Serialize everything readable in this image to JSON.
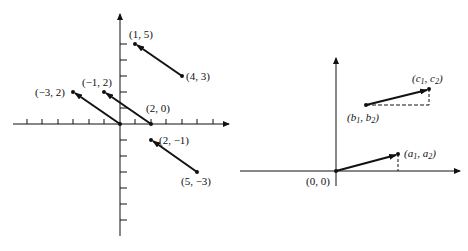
{
  "left_diagram": {
    "title": "",
    "origin_px": [
      120,
      124
    ],
    "unit_px": [
      15.5,
      16
    ],
    "x_ticks": [
      -6,
      -5,
      -4,
      -3,
      -2,
      -1,
      1,
      2,
      3,
      4,
      5,
      6
    ],
    "y_ticks": [
      -7,
      -6,
      -5,
      -4,
      -3,
      -2,
      -1,
      1,
      2,
      3,
      4,
      5
    ],
    "vectors": [
      {
        "from": [
          4,
          3
        ],
        "to": [
          1,
          5
        ],
        "from_label": "(4, 3)",
        "to_label": "(1, 5)"
      },
      {
        "from": [
          2,
          0
        ],
        "to": [
          -1,
          2
        ],
        "from_label": "(2, 0)",
        "to_label": "(−1, 2)"
      },
      {
        "from": [
          0,
          0
        ],
        "to": [
          -3,
          2
        ],
        "from_label": "",
        "to_label": "(−3, 2)"
      },
      {
        "from": [
          5,
          -3
        ],
        "to": [
          2,
          -1
        ],
        "from_label": "(5, −3)",
        "to_label": "(2, −1)"
      }
    ],
    "labels": {
      "p15": "(1, 5)",
      "p43": "(4, 3)",
      "pm12": "(−1, 2)",
      "pm32": "(−3, 2)",
      "p20": "(2, 0)",
      "p2m1": "(2, −1)",
      "p5m3": "(5, −3)"
    }
  },
  "right_diagram": {
    "labels": {
      "origin": "(0, 0)",
      "a": "(a",
      "a_sub1": "1",
      "a_mid": ", a",
      "a_sub2": "2",
      "a_end": ")",
      "b": "(b",
      "b_sub1": "1",
      "b_mid": ", b",
      "b_sub2": "2",
      "b_end": ")",
      "c": "(c",
      "c_sub1": "1",
      "c_mid": ", c",
      "c_sub2": "2",
      "c_end": ")"
    },
    "vectors": [
      {
        "from": "(0, 0)",
        "to": "(a1, a2)"
      },
      {
        "from": "(b1, b2)",
        "to": "(c1, c2)"
      }
    ],
    "construction_lines": [
      "dashed horizontal from (b1,b2)",
      "dashed vertical to (c1,c2)",
      "dashed vertical under (a1,a2)"
    ]
  },
  "colors": {
    "ink": "#111111",
    "background": "#ffffff"
  }
}
